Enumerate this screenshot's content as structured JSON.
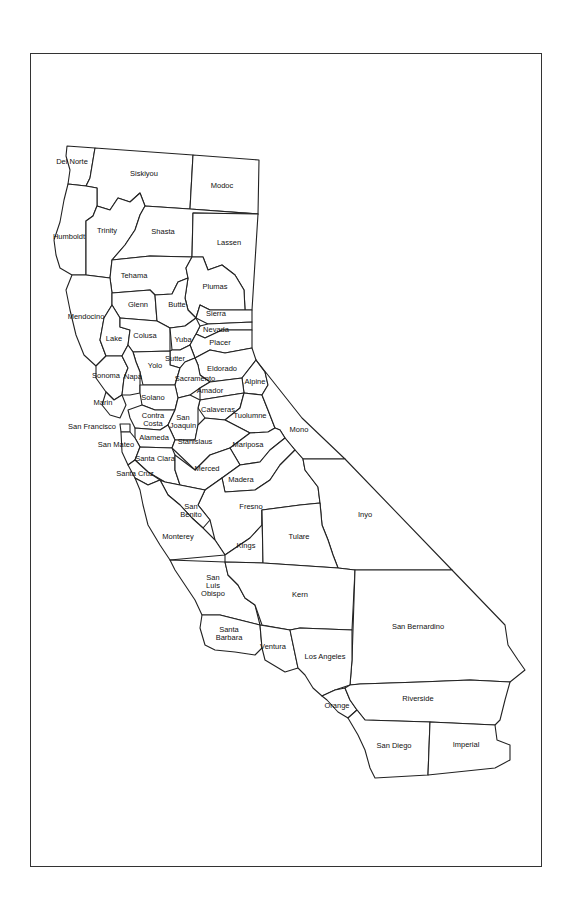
{
  "map": {
    "title": "California Counties",
    "stroke_color": "#222222",
    "fill_color": "#ffffff",
    "counties": [
      {
        "name": "Del Norte",
        "x": 72,
        "y": 162
      },
      {
        "name": "Siskiyou",
        "x": 144,
        "y": 174
      },
      {
        "name": "Modoc",
        "x": 222,
        "y": 186
      },
      {
        "name": "Humboldt",
        "x": 69,
        "y": 237
      },
      {
        "name": "Trinity",
        "x": 107,
        "y": 231
      },
      {
        "name": "Shasta",
        "x": 163,
        "y": 232
      },
      {
        "name": "Lassen",
        "x": 229,
        "y": 243
      },
      {
        "name": "Tehama",
        "x": 134,
        "y": 276
      },
      {
        "name": "Plumas",
        "x": 215,
        "y": 287
      },
      {
        "name": "Glenn",
        "x": 138,
        "y": 305
      },
      {
        "name": "Butte",
        "x": 177,
        "y": 305
      },
      {
        "name": "Mendocino",
        "x": 86,
        "y": 317
      },
      {
        "name": "Sierra",
        "x": 216,
        "y": 314
      },
      {
        "name": "Nevada",
        "x": 216,
        "y": 330
      },
      {
        "name": "Lake",
        "x": 114,
        "y": 339
      },
      {
        "name": "Colusa",
        "x": 145,
        "y": 336
      },
      {
        "name": "Yuba",
        "x": 183,
        "y": 340
      },
      {
        "name": "Placer",
        "x": 220,
        "y": 343
      },
      {
        "name": "Sutter",
        "x": 175,
        "y": 359
      },
      {
        "name": "Yolo",
        "x": 155,
        "y": 366
      },
      {
        "name": "Eldorado",
        "x": 222,
        "y": 369
      },
      {
        "name": "Sonoma",
        "x": 106,
        "y": 376
      },
      {
        "name": "Napa",
        "x": 133,
        "y": 377
      },
      {
        "name": "Sacramento",
        "x": 195,
        "y": 379
      },
      {
        "name": "Alpine",
        "x": 255,
        "y": 382
      },
      {
        "name": "Amador",
        "x": 210,
        "y": 391
      },
      {
        "name": "Solano",
        "x": 153,
        "y": 398
      },
      {
        "name": "Marin",
        "x": 103,
        "y": 403
      },
      {
        "name": "Calaveras",
        "x": 218,
        "y": 410
      },
      {
        "name": "Tuolumne",
        "x": 250,
        "y": 416
      },
      {
        "name": "Mono",
        "x": 299,
        "y": 430
      },
      {
        "name": "Contra\nCosta",
        "x": 153,
        "y": 420
      },
      {
        "name": "San\nJoaquin",
        "x": 183,
        "y": 422
      },
      {
        "name": "San Francisco",
        "x": 92,
        "y": 427
      },
      {
        "name": "Alameda",
        "x": 154,
        "y": 438
      },
      {
        "name": "San Mateo",
        "x": 116,
        "y": 445
      },
      {
        "name": "Stanislaus",
        "x": 195,
        "y": 442
      },
      {
        "name": "Mariposa",
        "x": 248,
        "y": 445
      },
      {
        "name": "Santa Clara",
        "x": 155,
        "y": 459
      },
      {
        "name": "Madera",
        "x": 241,
        "y": 480
      },
      {
        "name": "Merced",
        "x": 207,
        "y": 469
      },
      {
        "name": "Santa Cruz",
        "x": 135,
        "y": 474
      },
      {
        "name": "Fresno",
        "x": 251,
        "y": 507
      },
      {
        "name": "San\nBenito",
        "x": 191,
        "y": 511
      },
      {
        "name": "Inyo",
        "x": 365,
        "y": 515
      },
      {
        "name": "Monterey",
        "x": 178,
        "y": 537
      },
      {
        "name": "Kings",
        "x": 246,
        "y": 546
      },
      {
        "name": "Tulare",
        "x": 299,
        "y": 537
      },
      {
        "name": "San\nLuis\nObispo",
        "x": 213,
        "y": 586
      },
      {
        "name": "Kern",
        "x": 300,
        "y": 595
      },
      {
        "name": "San Bernardino",
        "x": 418,
        "y": 627
      },
      {
        "name": "Santa\nBarbara",
        "x": 229,
        "y": 634
      },
      {
        "name": "Ventura",
        "x": 273,
        "y": 647
      },
      {
        "name": "Los Angeles",
        "x": 325,
        "y": 657
      },
      {
        "name": "Riverside",
        "x": 418,
        "y": 699
      },
      {
        "name": "Orange",
        "x": 337,
        "y": 706
      },
      {
        "name": "San Diego",
        "x": 394,
        "y": 746
      },
      {
        "name": "Imperial",
        "x": 466,
        "y": 745
      }
    ]
  }
}
